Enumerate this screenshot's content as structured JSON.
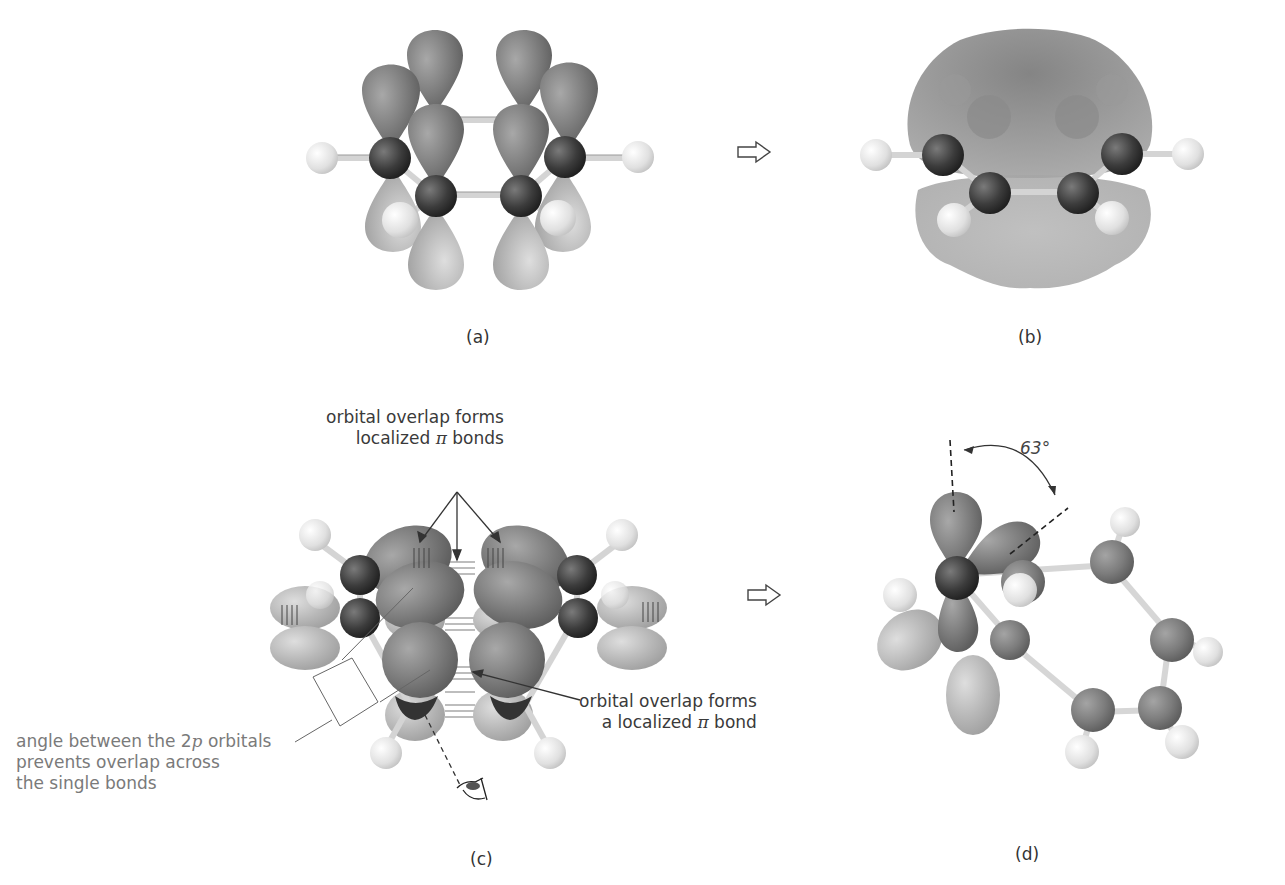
{
  "figure": {
    "panels": [
      {
        "id": "a",
        "label": "(a)",
        "description": "p orbitals on each carbon of cyclooctatetraene-like ring, side view"
      },
      {
        "id": "b",
        "label": "(b)",
        "description": "delocalized electron cloud above and below ring"
      },
      {
        "id": "c",
        "label": "(c)",
        "description": "tub-shaped conformation with localized pi bonds"
      },
      {
        "id": "d",
        "label": "(d)",
        "description": "view along bond showing angle between 2p orbitals"
      }
    ],
    "arrows": [
      {
        "from": "a",
        "to": "b",
        "glyph": "hollow-right-arrow"
      },
      {
        "from": "c",
        "to": "d",
        "glyph": "hollow-right-arrow"
      }
    ],
    "annotations": {
      "top_c_line1": "orbital overlap forms",
      "top_c_line2_pre": "localized ",
      "top_c_line2_pi": "π",
      "top_c_line2_post": " bonds",
      "right_c_line1": "orbital overlap forms",
      "right_c_line2_pre": "a localized ",
      "right_c_line2_pi": "π",
      "right_c_line2_post": " bond",
      "left_c_line1_pre": "angle between the 2",
      "left_c_line1_p": "p",
      "left_c_line1_post": " orbitals",
      "left_c_line2": "prevents overlap across",
      "left_c_line3": "the single bonds",
      "angle_d": "63°"
    },
    "colors": {
      "orbital_dark": "#7a7a7a",
      "orbital_light": "#b4b4b4",
      "carbon": "#3c3c3c",
      "hydrogen": "#dcdcdc",
      "bond": "#d0d0d0",
      "text": "#3a3a3a",
      "text_gray": "#7a7a7a"
    }
  }
}
